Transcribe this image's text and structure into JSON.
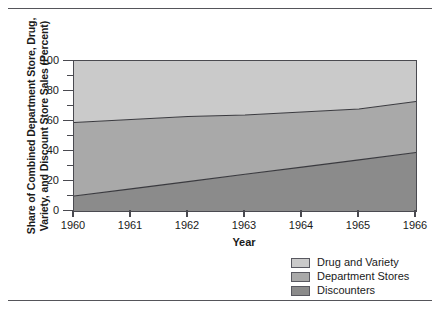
{
  "figure": {
    "has_top_rule": true,
    "has_bottom_rule": true
  },
  "chart_data": {
    "type": "area",
    "stacked": true,
    "title": "",
    "xlabel": "Year",
    "ylabel": "Share of Combined Department Store, Drug, Variety, and Discount Store Sales (Percent)",
    "ylabel_line1": "Share of Combined Department Store, Drug,",
    "ylabel_line2": "Variety, and Discount Store Sales (Percent)",
    "x": [
      1960,
      1961,
      1962,
      1963,
      1964,
      1965,
      1966
    ],
    "categories": [
      "1960",
      "1961",
      "1962",
      "1963",
      "1964",
      "1965",
      "1966"
    ],
    "xlim": [
      1960,
      1966
    ],
    "ylim": [
      0,
      100
    ],
    "ytick_values": [
      0,
      20,
      40,
      60,
      80,
      100
    ],
    "ytick_labels": [
      "0",
      "20",
      "40",
      "60",
      "80",
      "100"
    ],
    "yminor_tick_values": [
      10,
      30,
      50,
      70,
      90
    ],
    "grid": false,
    "legend_position": "below-right",
    "series": [
      {
        "name": "Discounters",
        "color": "#8b8b8b",
        "values": [
          10,
          14.8,
          19.6,
          24.5,
          29.3,
          34.1,
          39
        ]
      },
      {
        "name": "Department Stores",
        "color": "#a9a9a9",
        "values": [
          49,
          46.2,
          43.4,
          39.5,
          36.7,
          33.9,
          34
        ],
        "cumulative_top": [
          59,
          61,
          63,
          64,
          66,
          68,
          73
        ]
      },
      {
        "name": "Drug and Variety",
        "color": "#cacaca",
        "values": [
          41,
          39,
          37,
          36,
          34,
          32,
          27
        ],
        "cumulative_top": [
          100,
          100,
          100,
          100,
          100,
          100,
          100
        ]
      }
    ],
    "boundaries": {
      "discounters_top": [
        10,
        14.8,
        19.6,
        24.5,
        29.3,
        34.1,
        39
      ],
      "department_stores_top": [
        59,
        61,
        63,
        64,
        66,
        68,
        73
      ],
      "total_top": [
        100,
        100,
        100,
        100,
        100,
        100,
        100
      ]
    }
  },
  "legend": {
    "items": [
      {
        "label": "Drug and Variety",
        "color": "#cacaca"
      },
      {
        "label": "Department Stores",
        "color": "#a9a9a9"
      },
      {
        "label": "Discounters",
        "color": "#8b8b8b"
      }
    ]
  },
  "axes": {
    "x_title": "Year",
    "y_title_line1": "Share of Combined Department Store, Drug,",
    "y_title_line2": "Variety, and Discount Store Sales (Percent)"
  }
}
